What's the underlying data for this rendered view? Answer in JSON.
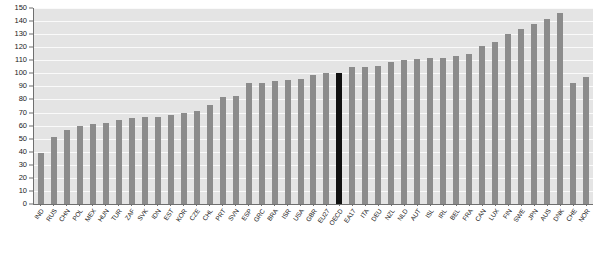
{
  "chart_data": {
    "type": "bar",
    "title": "",
    "subtitle": "",
    "xlabel": "",
    "ylabel": "",
    "ylim": [
      0,
      150
    ],
    "ytick_step": 10,
    "grid": true,
    "legend": "none",
    "highlight_category": "OECD",
    "highlight_color": "#111111",
    "bar_color": "#8c8c8c",
    "plot_background": "#e4e4e4",
    "categories": [
      "IND",
      "RUS",
      "CHN",
      "POL",
      "MEX",
      "HUN",
      "TUR",
      "ZAF",
      "SVK",
      "IDN",
      "EST",
      "KOR",
      "CZE",
      "CHL",
      "PRT",
      "SVN",
      "ESP",
      "GRC",
      "BRA",
      "ISR",
      "USA",
      "GBR",
      "EU27",
      "OECD",
      "EA17",
      "ITA",
      "DEU",
      "NZL",
      "NLD",
      "AUT",
      "ISL",
      "IRL",
      "BEL",
      "FRA",
      "CAN",
      "LUX",
      "FIN",
      "SWE",
      "JPN",
      "AUS",
      "DNK",
      "CHE",
      "NOR"
    ],
    "values": [
      39,
      51,
      57,
      60,
      61,
      62,
      64,
      66,
      67,
      67,
      68,
      70,
      71,
      76,
      82,
      83,
      93,
      93,
      94,
      95,
      96,
      99,
      100,
      100,
      105,
      105,
      106,
      109,
      110,
      111,
      112,
      112,
      113,
      115,
      121,
      124,
      130,
      134,
      138,
      142,
      146,
      93,
      97
    ],
    "yticks": [
      0,
      10,
      20,
      30,
      40,
      50,
      60,
      70,
      80,
      90,
      100,
      110,
      120,
      130,
      140,
      150
    ],
    "ytick_labels": [
      "0",
      "10",
      "20",
      "30",
      "40",
      "50",
      "60",
      "70",
      "80",
      "90",
      "100",
      "110",
      "120",
      "130",
      "140",
      "150"
    ]
  },
  "series_final": {
    "categories": [
      "IND",
      "RUS",
      "CHN",
      "POL",
      "MEX",
      "HUN",
      "TUR",
      "ZAF",
      "SVK",
      "IDN",
      "EST",
      "KOR",
      "CZE",
      "CHL",
      "PRT",
      "SVN",
      "ESP",
      "GRC",
      "BRA",
      "ISR",
      "USA",
      "GBR",
      "EU27",
      "OECD",
      "EA17",
      "ITA",
      "DEU",
      "NZL",
      "NLD",
      "AUT",
      "ISL",
      "IRL",
      "BEL",
      "FRA",
      "CAN",
      "LUX",
      "FIN",
      "SWE",
      "JPN",
      "AUS",
      "DNK",
      "CHE",
      "NOR"
    ],
    "values": [
      39,
      51,
      57,
      60,
      61,
      62,
      64,
      66,
      67,
      67,
      68,
      70,
      71,
      76,
      82,
      83,
      93,
      93,
      94,
      95,
      96,
      99,
      100,
      100,
      105,
      105,
      106,
      109,
      110,
      111,
      112,
      112,
      113,
      115,
      121,
      124,
      130,
      134,
      138,
      142,
      146,
      93,
      97
    ]
  }
}
